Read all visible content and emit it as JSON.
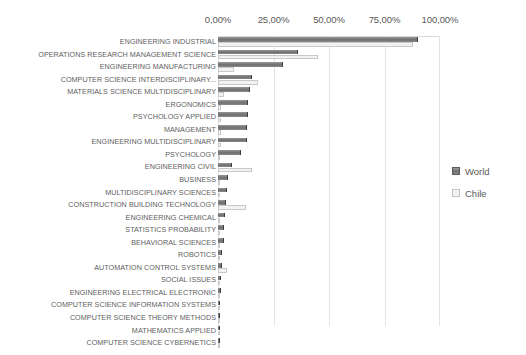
{
  "chart_data": {
    "type": "bar",
    "orientation": "horizontal",
    "title": "",
    "xlabel": "",
    "ylabel": "",
    "xlim": [
      0,
      100
    ],
    "grid": true,
    "legend_position": "right",
    "tick_labels": [
      "0,00%",
      "25,00%",
      "50,00%",
      "75,00%",
      "100,00%"
    ],
    "tick_values": [
      0,
      25,
      50,
      75,
      100
    ],
    "categories": [
      "ENGINEERING INDUSTRIAL",
      "OPERATIONS RESEARCH MANAGEMENT SCIENCE",
      "ENGINEERING MANUFACTURING",
      "COMPUTER SCIENCE INTERDISCIPLINARY...",
      "MATERIALS SCIENCE MULTIDISCIPLINARY",
      "ERGONOMICS",
      "PSYCHOLOGY APPLIED",
      "MANAGEMENT",
      "ENGINEERING MULTIDISCIPLINARY",
      "PSYCHOLOGY",
      "ENGINEERING CIVIL",
      "BUSINESS",
      "MULTIDISCIPLINARY SCIENCES",
      "CONSTRUCTION BUILDING TECHNOLOGY",
      "ENGINEERING CHEMICAL",
      "STATISTICS PROBABILITY",
      "BEHAVIORAL SCIENCES",
      "ROBOTICS",
      "AUTOMATION CONTROL SYSTEMS",
      "SOCIAL ISSUES",
      "ENGINEERING ELECTRICAL ELECTRONIC",
      "COMPUTER SCIENCE INFORMATION SYSTEMS",
      "COMPUTER SCIENCE THEORY METHODS",
      "MATHEMATICS APPLIED",
      "COMPUTER SCIENCE CYBERNETICS"
    ],
    "series": [
      {
        "name": "World",
        "color": "#7d7d7d",
        "values": [
          90.0,
          36.0,
          29.5,
          15.5,
          14.5,
          13.5,
          13.5,
          13.0,
          13.0,
          10.5,
          6.5,
          4.5,
          4.0,
          3.5,
          3.0,
          2.5,
          2.5,
          2.0,
          2.0,
          1.5,
          1.2,
          0.8,
          0.8,
          0.7,
          0.7
        ]
      },
      {
        "name": "Chile",
        "color": "#f2f2f2",
        "values": [
          88.0,
          45.0,
          7.0,
          18.0,
          2.5,
          1.5,
          1.5,
          1.5,
          1.5,
          1.0,
          15.5,
          1.0,
          1.0,
          12.5,
          1.0,
          0.8,
          0.8,
          0.8,
          4.0,
          0.6,
          0.5,
          0.4,
          0.4,
          0.4,
          0.4
        ]
      }
    ]
  },
  "legend": {
    "items": [
      {
        "label": "World"
      },
      {
        "label": "Chile"
      }
    ]
  }
}
